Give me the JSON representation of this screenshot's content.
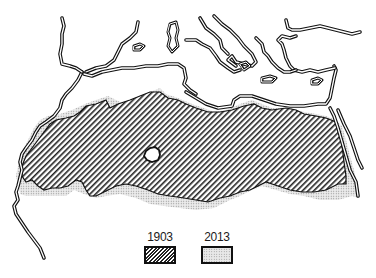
{
  "map": {
    "subject": "Sahara desert extent",
    "region": "North Africa and Mediterranean",
    "colors": {
      "coastline": "#111111",
      "hatch": "#222222",
      "stipple_bg": "#e8e8e8",
      "stipple_dot": "#888888",
      "background": "#ffffff"
    }
  },
  "legend": {
    "items": [
      {
        "label": "1903",
        "pattern": "diagonal-hatch"
      },
      {
        "label": "2013",
        "pattern": "stipple"
      }
    ]
  }
}
